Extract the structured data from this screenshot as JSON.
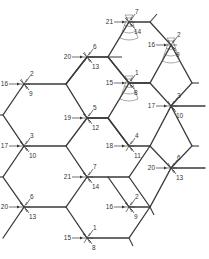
{
  "diagram": {
    "title": "",
    "colors": {
      "line": "#3a3a3a",
      "text": "#333333",
      "background": "#ffffff"
    },
    "junctions": [
      {
        "id": "j1",
        "x": 87,
        "y": 57,
        "left": "20",
        "top": "6",
        "bottom": "13",
        "cone": false
      },
      {
        "id": "j2",
        "x": 129,
        "y": 22,
        "left": "21",
        "top": "7",
        "bottom": "14",
        "cone": true
      },
      {
        "id": "j3",
        "x": 171,
        "y": 45,
        "left": "16",
        "top": "2",
        "bottom": "9",
        "cone": true
      },
      {
        "id": "j4",
        "x": 129,
        "y": 83,
        "left": "15",
        "top": "1",
        "bottom": "8",
        "cone": true
      },
      {
        "id": "j5",
        "x": 24,
        "y": 84,
        "left": "16",
        "top": "2",
        "bottom": "9",
        "cone": false
      },
      {
        "id": "j6",
        "x": 87,
        "y": 118,
        "left": "19",
        "top": "5",
        "bottom": "12",
        "cone": false
      },
      {
        "id": "j7",
        "x": 171,
        "y": 106,
        "left": "17",
        "top": "3",
        "bottom": "10",
        "cone": false
      },
      {
        "id": "j8",
        "x": 24,
        "y": 146,
        "left": "17",
        "top": "3",
        "bottom": "10",
        "cone": false
      },
      {
        "id": "j9",
        "x": 129,
        "y": 146,
        "left": "18",
        "top": "4",
        "bottom": "11",
        "cone": false
      },
      {
        "id": "j10",
        "x": 87,
        "y": 177,
        "left": "21",
        "top": "7",
        "bottom": "14",
        "cone": false
      },
      {
        "id": "j11",
        "x": 171,
        "y": 168,
        "left": "20",
        "top": "6",
        "bottom": "13",
        "cone": false
      },
      {
        "id": "j12",
        "x": 24,
        "y": 207,
        "left": "20",
        "top": "6",
        "bottom": "13",
        "cone": false
      },
      {
        "id": "j13",
        "x": 129,
        "y": 207,
        "left": "16",
        "top": "2",
        "bottom": "9",
        "cone": false
      },
      {
        "id": "j14",
        "x": 87,
        "y": 238,
        "left": "15",
        "top": "1",
        "bottom": "8",
        "cone": false
      }
    ]
  }
}
